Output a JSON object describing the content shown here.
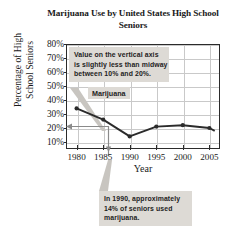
{
  "chart_data": {
    "type": "line",
    "title": "Marijuana Use by United States High School Seniors",
    "title_line1": "Marijuana Use by",
    "title_line2": "United States High School Seniors",
    "xlabel": "Year",
    "ylabel": "Percentage of High School Seniors",
    "ylabel_line1": "Percentage of High",
    "ylabel_line2": "School Seniors",
    "x": [
      1980,
      1985,
      1990,
      1995,
      2000,
      2005,
      2006
    ],
    "series": [
      {
        "name": "Marijuana",
        "values": [
          34,
          26,
          14,
          21,
          22,
          20,
          18
        ]
      }
    ],
    "xlim": [
      1978,
      2007
    ],
    "ylim": [
      5,
      80
    ],
    "xticks": [
      1980,
      1985,
      1990,
      1995,
      2000,
      2005
    ],
    "xtick_labels": [
      "1980",
      "1985",
      "1990",
      "1995",
      "2000",
      "2005"
    ],
    "yticks": [
      10,
      20,
      30,
      40,
      50,
      60,
      70,
      80
    ],
    "ytick_labels": [
      "10%",
      "20%",
      "30%",
      "40%",
      "50%",
      "60%",
      "70%",
      "80%"
    ],
    "grid": true,
    "legend_position": "inline-label",
    "line_color": "#2b2b2b",
    "marker_color": "#2b2b2b",
    "grid_color": "#c9c9c9",
    "axis_color": "#2b2b2b",
    "annotations": [
      {
        "id": "vertical-axis-note",
        "lines": [
          "Value on the vertical axis",
          "is slightly less than midway",
          "between 10% and 20%."
        ],
        "points_to": "y-axis value of 1990 data point"
      },
      {
        "id": "year-1990-note",
        "lines": [
          "In 1990, approximately",
          "14% of seniors used",
          "marijuana."
        ],
        "points_to": "1990 data point"
      }
    ]
  },
  "callouts": {
    "top": {
      "line1": "Value on the vertical axis",
      "line2": "is slightly less than midway",
      "line3": "between 10% and 20%."
    },
    "bottom": {
      "line1": "In 1990, approximately",
      "line2": "14% of seniors used",
      "line3": "marijuana."
    }
  },
  "series_label": "Marijuana",
  "colors": {
    "callout_bg": "#dddad5",
    "text": "#1a1a1a",
    "leader": "#b9b6b1",
    "arrow": "#8a8a8a"
  }
}
